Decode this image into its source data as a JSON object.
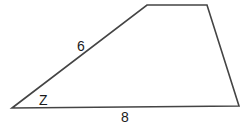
{
  "diagram": {
    "shape": "trapezoid",
    "vertices": [
      [
        12,
        108
      ],
      [
        147,
        5
      ],
      [
        207,
        5
      ],
      [
        239,
        106
      ]
    ],
    "stroke_color": "#444444",
    "labels": {
      "left_side": "6",
      "angle": "Z",
      "base": "8"
    }
  }
}
